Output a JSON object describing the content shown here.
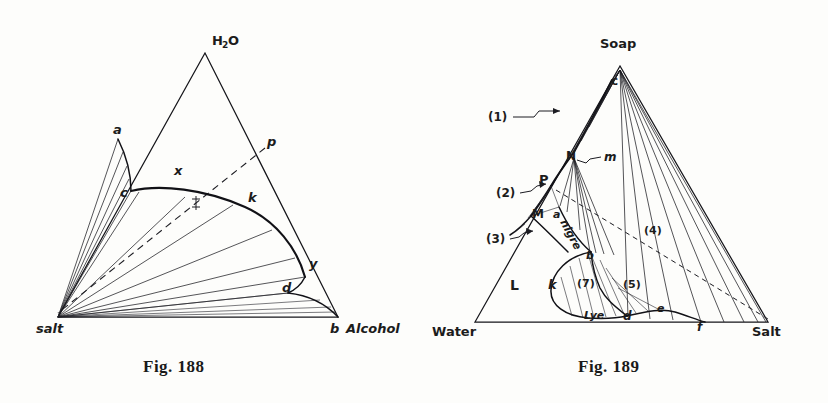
{
  "page": {
    "background_color": "#fdfdfb",
    "ink_color": "#15151a",
    "width": 828,
    "height": 403,
    "kind": "two hand-drawn ternary phase diagrams"
  },
  "figures": [
    {
      "id": "fig-188",
      "caption": "Fig. 188",
      "type": "ternary-phase-diagram",
      "vertices": [
        {
          "key": "apex",
          "label": "H₂O",
          "x": 205,
          "y": 53
        },
        {
          "key": "bottom_left",
          "label": "salt",
          "x": 58,
          "y": 317
        },
        {
          "key": "bottom_right",
          "label": "b  Alcohol",
          "x": 338,
          "y": 317
        }
      ],
      "point_labels": [
        {
          "name": "a",
          "label": "a",
          "x": 118,
          "y": 131
        },
        {
          "name": "c",
          "label": "c",
          "x": 127,
          "y": 193
        },
        {
          "name": "x",
          "label": "x",
          "x": 178,
          "y": 170
        },
        {
          "name": "f",
          "label": "f",
          "x": 196,
          "y": 203
        },
        {
          "name": "k",
          "label": "k",
          "x": 252,
          "y": 198
        },
        {
          "name": "p",
          "label": "p",
          "x": 271,
          "y": 141
        },
        {
          "name": "y",
          "label": "y",
          "x": 314,
          "y": 264
        },
        {
          "name": "d",
          "label": "d",
          "x": 287,
          "y": 288
        }
      ],
      "regions": [
        "two-liquid binodal dome c-k-y-d",
        "salt + solution fan",
        "a-c solubility branch"
      ],
      "features": {
        "dashed_line": "p through f to salt corner",
        "tie_line_fan_origin": "salt corner",
        "binodal_curve": "c → x → k → y → d"
      }
    },
    {
      "id": "fig-189",
      "caption": "Fig. 189",
      "type": "ternary-phase-diagram",
      "vertices": [
        {
          "key": "apex",
          "label": "Soap",
          "x": 620,
          "y": 66
        },
        {
          "key": "bottom_left",
          "label": "Water",
          "x": 475,
          "y": 322
        },
        {
          "key": "bottom_right",
          "label": "Salt",
          "x": 768,
          "y": 322
        }
      ],
      "point_labels": [
        {
          "name": "c",
          "label": "c",
          "x": 616,
          "y": 80
        },
        {
          "name": "N",
          "label": "N",
          "x": 571,
          "y": 155
        },
        {
          "name": "m",
          "label": "m",
          "x": 608,
          "y": 156
        },
        {
          "name": "P",
          "label": "P",
          "x": 544,
          "y": 181
        },
        {
          "name": "M",
          "label": "M",
          "x": 538,
          "y": 213
        },
        {
          "name": "a",
          "label": "a",
          "x": 557,
          "y": 214
        },
        {
          "name": "nigre",
          "label": "nigre",
          "x": 566,
          "y": 236
        },
        {
          "name": "b",
          "label": "b",
          "x": 589,
          "y": 255
        },
        {
          "name": "k",
          "label": "k",
          "x": 553,
          "y": 285
        },
        {
          "name": "L",
          "label": "L",
          "x": 515,
          "y": 285
        },
        {
          "name": "Lye",
          "label": "Lye",
          "x": 597,
          "y": 315
        },
        {
          "name": "d",
          "label": "d",
          "x": 627,
          "y": 316
        },
        {
          "name": "e",
          "label": "e",
          "x": 661,
          "y": 308
        },
        {
          "name": "f",
          "label": "f",
          "x": 701,
          "y": 326
        }
      ],
      "region_numbers": [
        {
          "label": "(1)",
          "x": 496,
          "y": 115,
          "has_leader": true
        },
        {
          "label": "(2)",
          "x": 504,
          "y": 192,
          "has_leader": true
        },
        {
          "label": "(3)",
          "x": 494,
          "y": 237,
          "has_leader": true
        },
        {
          "label": "(4)",
          "x": 650,
          "y": 230,
          "has_leader": false
        },
        {
          "label": "(5)",
          "x": 629,
          "y": 284,
          "has_leader": false
        },
        {
          "label": "(7)",
          "x": 583,
          "y": 283,
          "has_leader": false
        }
      ],
      "features": {
        "dashed_line": "from near P sloping down to the Salt corner",
        "tie_line_fan_origin": "Soap apex c",
        "lye_loop": "closed curve k → (7) → Lye → d",
        "nigre_curve": "a → nigre → b"
      }
    }
  ]
}
